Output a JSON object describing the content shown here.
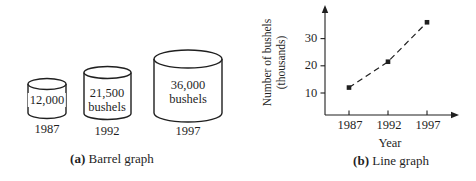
{
  "page": {
    "background": "#ffffff",
    "ink": "#1f1f1f"
  },
  "barrel_graph": {
    "caption_prefix": "(a)",
    "caption_text": "Barrel graph",
    "barrels": [
      {
        "value_label": "12,000",
        "unit_label": "",
        "year": "1987"
      },
      {
        "value_label": "21,500",
        "unit_label": "bushels",
        "year": "1992"
      },
      {
        "value_label": "36,000",
        "unit_label": "bushels",
        "year": "1997"
      }
    ]
  },
  "line_graph": {
    "caption_prefix": "(b)",
    "caption_text": "Line graph",
    "ylabel_line1": "Number of bushels",
    "ylabel_line2": "(thousands)",
    "xlabel": "Year",
    "ytick_labels": [
      "30",
      "20",
      "10"
    ],
    "xtick_labels": [
      "1987",
      "1992",
      "1997"
    ]
  },
  "chart_data": [
    {
      "type": "bar",
      "variant": "pictograph-cylinders",
      "title": "(a) Barrel graph",
      "categories": [
        "1987",
        "1992",
        "1997"
      ],
      "values": [
        12000,
        21500,
        36000
      ],
      "value_labels": [
        "12,000",
        "21,500 bushels",
        "36,000 bushels"
      ],
      "unit": "bushels"
    },
    {
      "type": "line",
      "title": "(b) Line graph",
      "x": [
        1987,
        1992,
        1997
      ],
      "values": [
        12,
        21.5,
        36
      ],
      "xlabel": "Year",
      "ylabel": "Number of bushels (thousands)",
      "yticks": [
        10,
        20,
        30
      ],
      "xticks": [
        1987,
        1992,
        1997
      ],
      "ylim": [
        0,
        38
      ],
      "line_style": "dashed",
      "marker": "square",
      "legend": "none",
      "grid": false
    }
  ]
}
